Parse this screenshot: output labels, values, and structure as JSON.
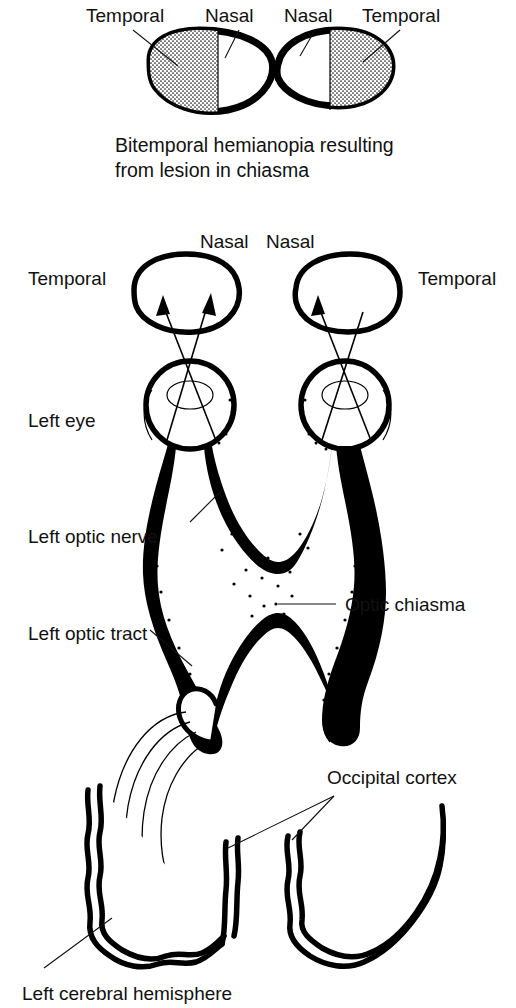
{
  "figure": {
    "background_color": "#ffffff",
    "ink_color": "#000000"
  },
  "top_panel": {
    "name": "bitemporal-hemianopia-fields",
    "left_field": {
      "outer_label": "Temporal",
      "inner_label": "Nasal",
      "shaded_side": "left"
    },
    "right_field": {
      "inner_label": "Nasal",
      "outer_label": "Temporal",
      "shaded_side": "right"
    },
    "caption_line1": "Bitemporal hemianopia resulting",
    "caption_line2": "from lesion in chiasma"
  },
  "pathway_panel": {
    "name": "visual-pathway",
    "field_left_outer_label": "Temporal",
    "field_left_inner_label": "Nasal",
    "field_right_inner_label": "Nasal",
    "field_right_outer_label": "Temporal",
    "eye_label": "Left eye",
    "optic_nerve_label": "Left optic nerve",
    "optic_chiasma_label": "Optic chiasma",
    "optic_tract_label": "Left optic tract",
    "occipital_cortex_label": "Occipital cortex",
    "cerebral_hemisphere_label": "Left cerebral hemisphere"
  }
}
